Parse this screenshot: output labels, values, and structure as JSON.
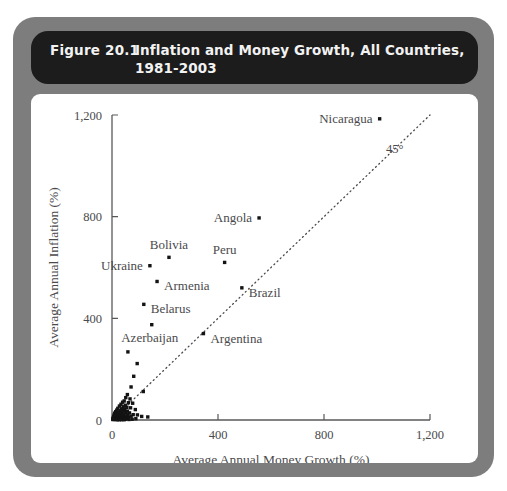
{
  "figure": {
    "number": "Figure 20.1",
    "title": "Inflation and Money Growth, All Countries, 1981-2003",
    "frame_color": "#7d7d7d",
    "title_bar_color": "#1c1c1c",
    "title_text_color": "#f2f2f2"
  },
  "chart_data": {
    "type": "scatter",
    "title": "Inflation and Money Growth, All Countries, 1981-2003",
    "xlabel": "Average Annual Money Growth (%)",
    "ylabel": "Average Annual Inflation (%)",
    "xlim": [
      0,
      1200
    ],
    "ylim": [
      0,
      1200
    ],
    "xticks": [
      0,
      400,
      800,
      1200
    ],
    "yticks": [
      0,
      400,
      800,
      1200
    ],
    "xtick_labels": [
      "0",
      "400",
      "800",
      "1,200"
    ],
    "ytick_labels": [
      "0",
      "400",
      "800",
      "1,200"
    ],
    "grid": false,
    "legend": "none",
    "reference_line": {
      "label": "45°",
      "style": "dotted",
      "slope": 1,
      "intercept": 0
    },
    "marker": "square",
    "marker_color": "#131313",
    "labeled_points": [
      {
        "label": "Nicaragua",
        "x": 1010,
        "y": 1185,
        "label_side": "left"
      },
      {
        "label": "Angola",
        "x": 555,
        "y": 795,
        "label_side": "left"
      },
      {
        "label": "Bolivia",
        "x": 215,
        "y": 640,
        "label_side": "above"
      },
      {
        "label": "Peru",
        "x": 425,
        "y": 620,
        "label_side": "above"
      },
      {
        "label": "Ukraine",
        "x": 143,
        "y": 607,
        "label_side": "left"
      },
      {
        "label": "Armenia",
        "x": 170,
        "y": 545,
        "label_side": "right"
      },
      {
        "label": "Brazil",
        "x": 490,
        "y": 520,
        "label_side": "right"
      },
      {
        "label": "Belarus",
        "x": 120,
        "y": 455,
        "label_side": "right"
      },
      {
        "label": "Azerbaijan",
        "x": 150,
        "y": 375,
        "label_side": "below"
      },
      {
        "label": "Argentina",
        "x": 345,
        "y": 340,
        "label_side": "right"
      }
    ],
    "unlabeled_points": [
      {
        "x": 60,
        "y": 268
      },
      {
        "x": 95,
        "y": 222
      },
      {
        "x": 82,
        "y": 172
      },
      {
        "x": 72,
        "y": 130
      },
      {
        "x": 118,
        "y": 112
      },
      {
        "x": 58,
        "y": 100
      },
      {
        "x": 52,
        "y": 88
      },
      {
        "x": 68,
        "y": 83
      },
      {
        "x": 46,
        "y": 75
      },
      {
        "x": 40,
        "y": 70
      },
      {
        "x": 62,
        "y": 68
      },
      {
        "x": 78,
        "y": 66
      },
      {
        "x": 34,
        "y": 62
      },
      {
        "x": 50,
        "y": 58
      },
      {
        "x": 28,
        "y": 55
      },
      {
        "x": 42,
        "y": 52
      },
      {
        "x": 56,
        "y": 50
      },
      {
        "x": 70,
        "y": 48
      },
      {
        "x": 22,
        "y": 46
      },
      {
        "x": 36,
        "y": 44
      },
      {
        "x": 48,
        "y": 42
      },
      {
        "x": 88,
        "y": 41
      },
      {
        "x": 18,
        "y": 39
      },
      {
        "x": 30,
        "y": 37
      },
      {
        "x": 44,
        "y": 36
      },
      {
        "x": 58,
        "y": 35
      },
      {
        "x": 14,
        "y": 33
      },
      {
        "x": 26,
        "y": 31
      },
      {
        "x": 38,
        "y": 30
      },
      {
        "x": 52,
        "y": 29
      },
      {
        "x": 66,
        "y": 28
      },
      {
        "x": 10,
        "y": 27
      },
      {
        "x": 20,
        "y": 25
      },
      {
        "x": 32,
        "y": 24
      },
      {
        "x": 45,
        "y": 23
      },
      {
        "x": 60,
        "y": 22
      },
      {
        "x": 80,
        "y": 21
      },
      {
        "x": 8,
        "y": 20
      },
      {
        "x": 16,
        "y": 19
      },
      {
        "x": 24,
        "y": 18
      },
      {
        "x": 34,
        "y": 17
      },
      {
        "x": 44,
        "y": 16
      },
      {
        "x": 56,
        "y": 16
      },
      {
        "x": 72,
        "y": 15
      },
      {
        "x": 6,
        "y": 14
      },
      {
        "x": 13,
        "y": 13
      },
      {
        "x": 21,
        "y": 12
      },
      {
        "x": 29,
        "y": 12
      },
      {
        "x": 38,
        "y": 11
      },
      {
        "x": 48,
        "y": 11
      },
      {
        "x": 62,
        "y": 10
      },
      {
        "x": 96,
        "y": 20
      },
      {
        "x": 112,
        "y": 14
      },
      {
        "x": 135,
        "y": 12
      },
      {
        "x": 5,
        "y": 9
      },
      {
        "x": 11,
        "y": 8
      },
      {
        "x": 18,
        "y": 8
      },
      {
        "x": 25,
        "y": 7
      },
      {
        "x": 33,
        "y": 7
      },
      {
        "x": 42,
        "y": 6
      },
      {
        "x": 54,
        "y": 6
      },
      {
        "x": 4,
        "y": 5
      },
      {
        "x": 9,
        "y": 5
      },
      {
        "x": 15,
        "y": 4
      },
      {
        "x": 22,
        "y": 4
      },
      {
        "x": 30,
        "y": 3
      },
      {
        "x": 39,
        "y": 3
      },
      {
        "x": 50,
        "y": 3
      },
      {
        "x": 3,
        "y": 2
      },
      {
        "x": 8,
        "y": 2
      },
      {
        "x": 14,
        "y": 2
      },
      {
        "x": 20,
        "y": 1
      },
      {
        "x": 27,
        "y": 1
      },
      {
        "x": 36,
        "y": 1
      },
      {
        "x": 46,
        "y": 1
      },
      {
        "x": 64,
        "y": 2
      },
      {
        "x": 76,
        "y": 3
      },
      {
        "x": 90,
        "y": 5
      }
    ]
  }
}
